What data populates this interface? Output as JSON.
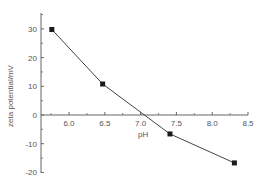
{
  "chart_data": {
    "type": "line",
    "title": "",
    "xlabel": "pH",
    "ylabel": "zeta potential/mV",
    "xlim": [
      5.6,
      8.5
    ],
    "ylim": [
      -20,
      35
    ],
    "x_ticks": [
      6.0,
      6.5,
      7.0,
      7.5,
      8.0,
      8.5
    ],
    "x_tick_labels": [
      "6.0",
      "6.5",
      "7.0",
      "7.5",
      "8.0",
      "8.5"
    ],
    "y_ticks": [
      30,
      20,
      10,
      0,
      -10,
      -20
    ],
    "y_tick_labels": [
      "30",
      "20",
      "10",
      "0",
      "-10",
      "-20"
    ],
    "grid": false,
    "legend": null,
    "series": [
      {
        "name": "zeta potential",
        "marker": "square",
        "color": "#333333",
        "x": [
          5.76,
          6.47,
          7.41,
          8.31
        ],
        "y": [
          29.8,
          10.8,
          -6.6,
          -16.7
        ]
      }
    ]
  },
  "colors": {
    "axis": "#666666",
    "line": "#444444",
    "marker": "#1a1a1a",
    "text": "#555555"
  }
}
